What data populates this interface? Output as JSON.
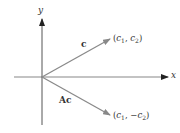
{
  "diagram": {
    "axes": {
      "x_label": "x",
      "y_label": "y",
      "color": "#777777"
    },
    "vectors": [
      {
        "name": "c",
        "label": "c",
        "endpoint_label": "(c1, c2)",
        "endpoint_parts": {
          "open": "(",
          "a": "c",
          "a_sub": "1",
          "sep": ", ",
          "neg": "",
          "b": "c",
          "b_sub": "2",
          "close": ")"
        },
        "direction": "up-right",
        "color": "#8a8a8a"
      },
      {
        "name": "Ac",
        "label": "Ac",
        "endpoint_label": "(c1, −c2)",
        "endpoint_parts": {
          "open": "(",
          "a": "c",
          "a_sub": "1",
          "sep": ", ",
          "neg": "−",
          "b": "c",
          "b_sub": "2",
          "close": ")"
        },
        "direction": "down-right",
        "color": "#8a8a8a"
      }
    ]
  }
}
